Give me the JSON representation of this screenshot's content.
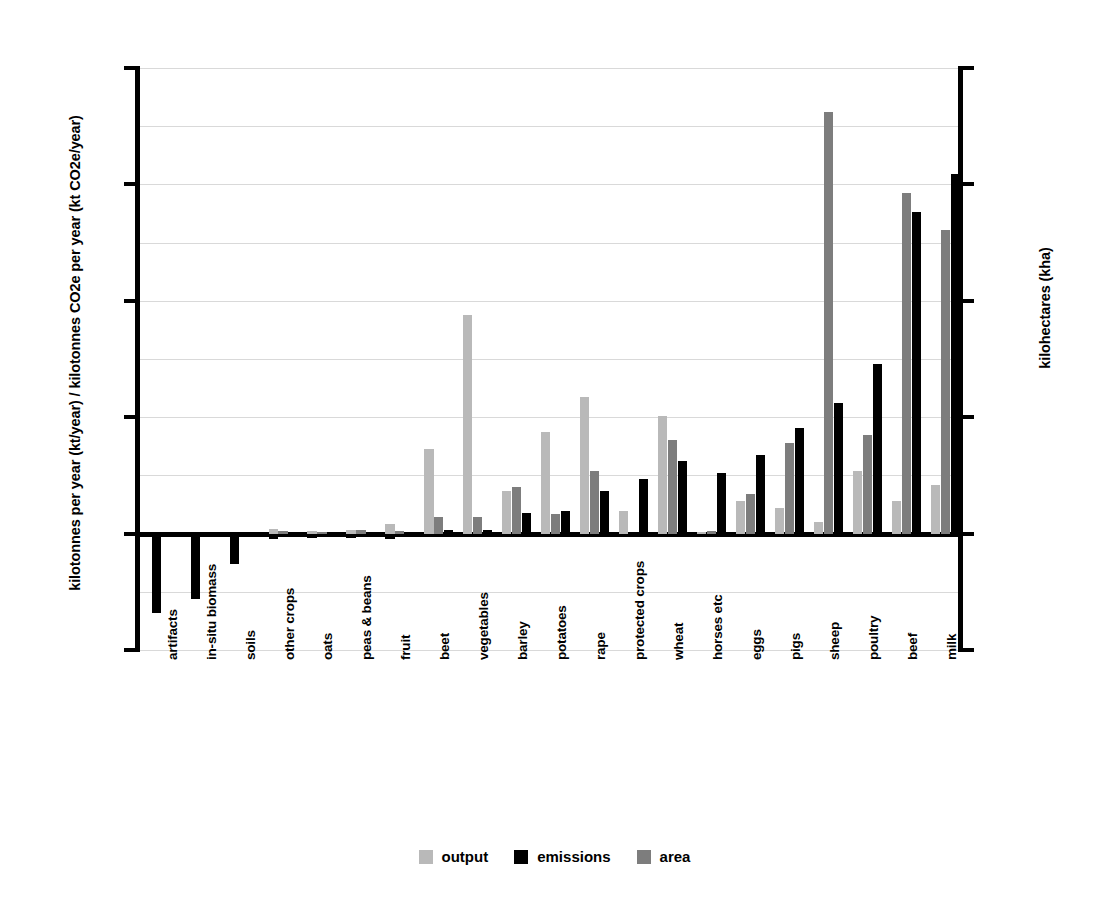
{
  "chart_data": {
    "type": "bar",
    "title": "",
    "subtitle": "",
    "xlabel": "",
    "ylabel": "kilotonnes per year (kt/year) / kilotonnes CO2e per year (kt CO2e/year)",
    "y2label": "kilohectares (kha)",
    "ylim": [
      -5000,
      20000
    ],
    "y2lim": [
      -1000,
      4000
    ],
    "yticks": [
      "20000",
      "15000",
      "10000",
      "5000",
      "0",
      "-5000"
    ],
    "ytick_values": [
      20000,
      15000,
      10000,
      5000,
      0,
      -5000
    ],
    "y2ticks": [
      "4000",
      "3000",
      "2000",
      "1000",
      "0",
      "-1000"
    ],
    "y2tick_values": [
      4000,
      3000,
      2000,
      1000,
      0,
      -1000
    ],
    "gridlines": [
      20000,
      17500,
      15000,
      12500,
      10000,
      7500,
      5000,
      2500,
      0,
      -2500,
      -5000
    ],
    "grid": true,
    "legend_position": "bottom-center",
    "categories": [
      "artifacts",
      "in-situ biomass",
      "soils",
      "other crops",
      "oats",
      "peas & beans",
      "fruit",
      "beet",
      "vegetables",
      "barley",
      "potatoes",
      "rape",
      "protected crops",
      "wheat",
      "horses etc",
      "eggs",
      "pigs",
      "sheep",
      "poultry",
      "beef",
      "milk"
    ],
    "series": [
      {
        "name": "output",
        "color": "#b9b9b9",
        "axis": "left",
        "values": [
          0,
          0,
          0,
          190,
          100,
          160,
          420,
          3620,
          9400,
          1820,
          4370,
          5870,
          950,
          5050,
          60,
          1420,
          1120,
          500,
          2690,
          1390,
          2100
        ]
      },
      {
        "name": "emissions",
        "color": "#000000",
        "axis": "left",
        "values": [
          -3400,
          -2820,
          -1320,
          -250,
          -180,
          -200,
          -230,
          -200,
          -240,
          -220,
          -250,
          -280,
          -2360,
          -2370,
          0,
          0,
          0,
          0,
          0,
          0,
          0
        ]
      },
      {
        "name": "emissions_positive",
        "color": "#000000",
        "axis": "left",
        "values": [
          0,
          0,
          0,
          0,
          0,
          0,
          0,
          150,
          160,
          900,
          990,
          1830,
          2360,
          3120,
          2590,
          3380,
          4530,
          5610,
          7280,
          13810,
          15430
        ]
      },
      {
        "name": "area",
        "color": "#7d7d7d",
        "axis": "right",
        "values": [
          0,
          0,
          0,
          20,
          10,
          30,
          20,
          140,
          140,
          400,
          170,
          540,
          0,
          800,
          20,
          340,
          780,
          3620,
          850,
          2930,
          2610
        ]
      }
    ],
    "series_right_axis_equivalent_left_units": {
      "note": "area series plotted against right axis (kha); value×5 gives left-axis pixel-equivalent",
      "values": [
        0,
        0,
        0,
        100,
        50,
        150,
        100,
        700,
        700,
        2000,
        850,
        2700,
        0,
        4000,
        100,
        1700,
        3900,
        18100,
        4250,
        14650,
        13050
      ]
    },
    "legend": [
      {
        "label": "output",
        "color": "#b9b9b9",
        "swatch": "square"
      },
      {
        "label": "emissions",
        "color": "#000000",
        "swatch": "square"
      },
      {
        "label": "area",
        "color": "#7d7d7d",
        "swatch": "square"
      }
    ]
  }
}
